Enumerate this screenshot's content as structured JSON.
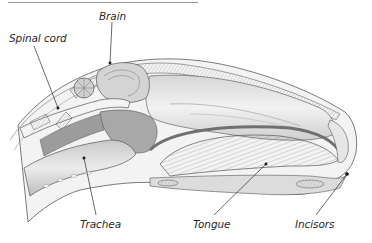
{
  "diagram": {
    "labels": [
      {
        "id": "brain",
        "text": "Brain",
        "x": 98,
        "y": 10,
        "line": [
          112,
          22,
          110,
          63
        ]
      },
      {
        "id": "spinal-cord",
        "text": "Spinal cord",
        "x": 9,
        "y": 32,
        "line": [
          34,
          46,
          58,
          108
        ]
      },
      {
        "id": "trachea",
        "text": "Trachea",
        "x": 80,
        "y": 219,
        "line": [
          96,
          215,
          84,
          158
        ]
      },
      {
        "id": "tongue",
        "text": "Tongue",
        "x": 193,
        "y": 219,
        "line": [
          214,
          215,
          266,
          164
        ]
      },
      {
        "id": "incisors",
        "text": "Incisors",
        "x": 295,
        "y": 219,
        "line": [
          316,
          215,
          347,
          174
        ]
      }
    ],
    "colors": {
      "ink": "#3a3a3a",
      "tissue_light": "#e9e9e9",
      "tissue_mid": "#bdbdbd",
      "tissue_dark": "#8a8a8a",
      "bone": "#d8d8d8",
      "rule": "#9a9a9a"
    }
  }
}
